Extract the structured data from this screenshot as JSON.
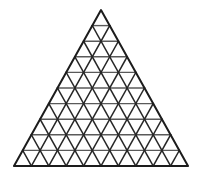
{
  "figure": {
    "background_color": "#ffffff"
  },
  "chart_data": {
    "type": "diagram",
    "diagram_kind": "triangular-lattice",
    "rows": 10,
    "columns_in_base_row": 10,
    "upward_triangle_count": 55,
    "downward_triangle_count": 45,
    "total_small_triangles": 100,
    "lattice_point_count": 66,
    "geometry": {
      "apex": [
        101,
        10
      ],
      "base_left": [
        14,
        166
      ],
      "base_right": [
        188,
        166
      ],
      "base_width": 174,
      "height": 156,
      "row_height": 15.6,
      "cell_width": 17.4
    },
    "line_families": [
      {
        "name": "horizontal",
        "count": 10,
        "color": "#5a5a5a",
        "width": 1.4,
        "description": "Lines parallel to the base, one per row boundary including the base."
      },
      {
        "name": "left-leaning",
        "count": 9,
        "color": "#262626",
        "width": 1.5,
        "description": "Interior lines parallel to the left outer edge."
      },
      {
        "name": "right-leaning",
        "count": 9,
        "color": "#262626",
        "width": 1.5,
        "description": "Interior lines parallel to the right outer edge."
      },
      {
        "name": "outline",
        "count": 3,
        "color": "#1c1c1c",
        "width": 2.0,
        "description": "The three outer edges of the bounding equilateral triangle."
      }
    ],
    "xlabel": "",
    "ylabel": "",
    "grid": true,
    "legend": false,
    "annotations": []
  },
  "colors": {
    "background": "#ffffff",
    "outline_stroke": "#1c1c1c",
    "diagonal_stroke": "#262626",
    "horizontal_stroke": "#5a5a5a"
  }
}
